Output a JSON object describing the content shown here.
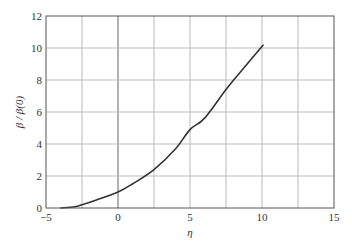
{
  "chart_data": {
    "type": "line",
    "title": "",
    "xlabel": "η",
    "ylabel": "β / β(0)",
    "xlim": [
      -5,
      15
    ],
    "ylim": [
      0,
      12
    ],
    "xticks": [
      -5,
      0,
      5,
      10,
      15
    ],
    "yticks": [
      0,
      2,
      4,
      6,
      8,
      10,
      12
    ],
    "grid": true,
    "grid_x": [
      -2.5,
      0,
      2.5,
      5,
      7.5,
      10,
      12.5
    ],
    "grid_y": [
      2,
      4,
      6,
      8,
      10
    ],
    "series": [
      {
        "name": "β/β(0)",
        "x": [
          -4.0,
          -3.0,
          -2.5,
          -1.5,
          0,
          1.0,
          2.5,
          4.0,
          5.0,
          6.0,
          7.5,
          8.5,
          10.1
        ],
        "y": [
          0.0,
          0.08,
          0.2,
          0.5,
          1.0,
          1.5,
          2.4,
          3.7,
          4.9,
          5.6,
          7.4,
          8.5,
          10.2
        ]
      }
    ]
  }
}
